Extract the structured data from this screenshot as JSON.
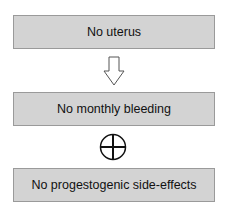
{
  "diagram": {
    "nodes": [
      {
        "id": "n1",
        "label": "No uterus"
      },
      {
        "id": "n2",
        "label": "No monthly bleeding"
      },
      {
        "id": "n3",
        "label": "No progestogenic side-effects"
      }
    ],
    "connectors": [
      {
        "from": "n1",
        "to": "n2",
        "type": "arrow-down-icon"
      },
      {
        "from": "n2",
        "to": "n3",
        "type": "plus-circle-icon"
      }
    ],
    "colors": {
      "box_fill": "#d3d3d3",
      "box_border": "#9a9a9a",
      "text": "#111111"
    }
  }
}
